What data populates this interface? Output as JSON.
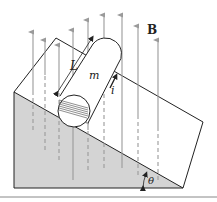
{
  "figure": {
    "type": "physics-diagram",
    "labels": {
      "field": "B",
      "length": "L",
      "mass": "m",
      "current": "i",
      "angle": "θ"
    },
    "colors": {
      "incline_fill": "#d4d4d4",
      "outline": "#222222",
      "field_arrows": "#9a9a9a",
      "background": "#ffffff",
      "rule": "#888888"
    },
    "field_direction": "upward (vertical)"
  }
}
